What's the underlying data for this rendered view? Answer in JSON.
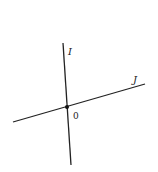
{
  "diagram": {
    "lines": [
      {
        "name": "I",
        "label": "I",
        "x1": 63,
        "y1": 43,
        "x2": 71,
        "y2": 165
      },
      {
        "name": "J",
        "label": "J",
        "x1": 13,
        "y1": 122,
        "x2": 145,
        "y2": 84
      }
    ],
    "origin": {
      "label": "0",
      "x": 67,
      "y": 107
    },
    "colors": {
      "line": "#222222",
      "background": "#ffffff"
    }
  }
}
